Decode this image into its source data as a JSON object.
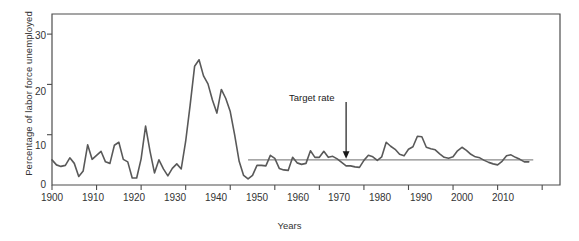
{
  "chart_data": {
    "type": "line",
    "title": "",
    "xlabel": "Years",
    "ylabel": "Percentage of labor force unemployed",
    "xlim": [
      1900,
      2014
    ],
    "ylim": [
      0,
      34
    ],
    "grid": false,
    "legend": "none",
    "xticks": [
      1900,
      1910,
      1920,
      1930,
      1940,
      1950,
      1960,
      1970,
      1980,
      1990,
      2000,
      2010
    ],
    "xtick_labels": [
      "1900",
      "1910",
      "1920",
      "1930",
      "1940",
      "1950",
      "1960",
      "1970",
      "1980",
      "1990",
      "2000",
      "2010"
    ],
    "yticks": [
      0,
      10,
      20,
      30
    ],
    "ytick_labels": [
      "0",
      "10",
      "20",
      "30"
    ],
    "series": [
      {
        "name": "Unemployment rate",
        "color": "#595959",
        "x": [
          1900,
          1901,
          1902,
          1903,
          1904,
          1905,
          1906,
          1907,
          1908,
          1909,
          1910,
          1911,
          1912,
          1913,
          1914,
          1915,
          1916,
          1917,
          1918,
          1919,
          1920,
          1921,
          1922,
          1923,
          1924,
          1925,
          1926,
          1927,
          1928,
          1929,
          1930,
          1931,
          1932,
          1933,
          1934,
          1935,
          1936,
          1937,
          1938,
          1939,
          1940,
          1941,
          1942,
          1943,
          1944,
          1945,
          1946,
          1947,
          1948,
          1949,
          1950,
          1951,
          1952,
          1953,
          1954,
          1955,
          1956,
          1957,
          1958,
          1959,
          1960,
          1961,
          1962,
          1963,
          1964,
          1965,
          1966,
          1967,
          1968,
          1969,
          1970,
          1971,
          1972,
          1973,
          1974,
          1975,
          1976,
          1977,
          1978,
          1979,
          1980,
          1981,
          1982,
          1983,
          1984,
          1985,
          1986,
          1987,
          1988,
          1989,
          1990,
          1991,
          1992,
          1993,
          1994,
          1995,
          1996,
          1997,
          1998,
          1999,
          2000,
          2001,
          2002,
          2003,
          2004,
          2005,
          2006,
          2007
        ],
        "values": [
          5.0,
          4.0,
          3.7,
          3.9,
          5.4,
          4.3,
          1.7,
          2.8,
          8.0,
          5.1,
          5.9,
          6.7,
          4.6,
          4.3,
          7.9,
          8.5,
          5.1,
          4.6,
          1.4,
          1.4,
          5.2,
          11.7,
          6.7,
          2.4,
          5.0,
          3.2,
          1.8,
          3.3,
          4.2,
          3.2,
          8.7,
          15.9,
          23.6,
          24.9,
          21.7,
          20.1,
          16.9,
          14.3,
          19.0,
          17.2,
          14.6,
          9.9,
          4.7,
          1.9,
          1.2,
          1.9,
          3.9,
          3.9,
          3.8,
          5.9,
          5.3,
          3.3,
          3.0,
          2.9,
          5.5,
          4.4,
          4.1,
          4.3,
          6.8,
          5.5,
          5.5,
          6.7,
          5.5,
          5.7,
          5.2,
          4.5,
          3.8,
          3.8,
          3.6,
          3.5,
          4.9,
          5.9,
          5.6,
          4.9,
          5.6,
          8.5,
          7.7,
          7.1,
          6.1,
          5.8,
          7.1,
          7.6,
          9.7,
          9.6,
          7.5,
          7.2,
          7.0,
          6.2,
          5.5,
          5.3,
          5.6,
          6.8,
          7.5,
          6.9,
          6.1,
          5.6,
          5.4,
          4.9,
          4.5,
          4.2,
          4.0,
          4.7,
          5.8,
          6.0,
          5.5,
          5.1,
          4.6,
          4.6
        ]
      }
    ],
    "reference_line": {
      "name": "Target rate",
      "value": 5.0,
      "x_start": 1944,
      "x_end": 2008,
      "color": "#8a8a8a"
    },
    "annotations": [
      {
        "name": "target-rate-annotation",
        "text": "Target rate",
        "x": 1966,
        "y": 16.5,
        "arrow_to_y": 5.0
      }
    ]
  },
  "axis": {
    "frame_color": "#4d4d4d"
  }
}
